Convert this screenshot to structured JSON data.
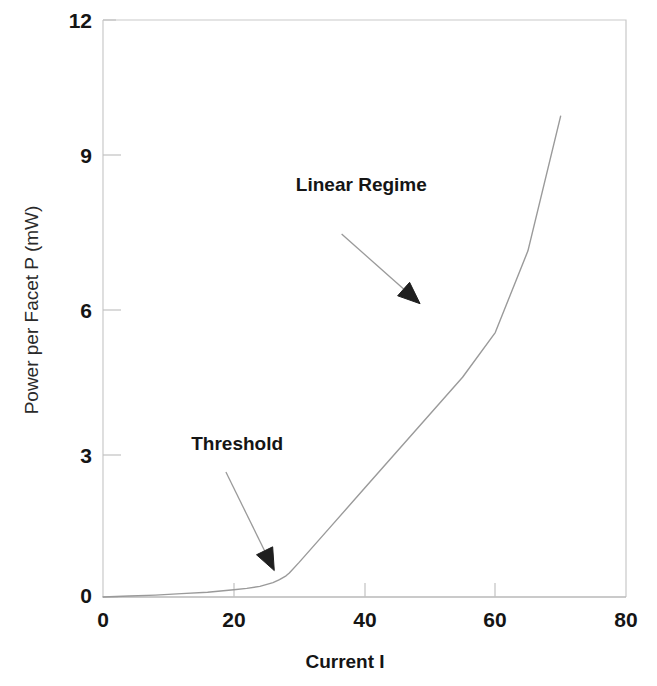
{
  "chart_data": {
    "type": "line",
    "title": "",
    "subtitle": "",
    "xlabel": "Current I",
    "ylabel": "Power per Facet P (mW)",
    "xlim": [
      0,
      80
    ],
    "ylim": [
      0,
      12
    ],
    "xticks": [
      0,
      20,
      40,
      60,
      80
    ],
    "yticks": [
      0,
      3,
      6,
      9,
      12
    ],
    "xtick_labels": [
      "0",
      "20",
      "40",
      "60",
      "80"
    ],
    "ytick_labels": [
      "0",
      "3",
      "6",
      "9",
      "12"
    ],
    "grid": false,
    "legend": null,
    "legend_position": "none",
    "series": [
      {
        "name": "L-I curve",
        "color": "#9a9a9a",
        "x": [
          0,
          4,
          8,
          12,
          16,
          20,
          22,
          24,
          26,
          27,
          28,
          28.5,
          30,
          35,
          40,
          45,
          50,
          55,
          60,
          65,
          70
        ],
        "y": [
          0.0,
          0.02,
          0.04,
          0.07,
          0.1,
          0.15,
          0.18,
          0.22,
          0.3,
          0.36,
          0.44,
          0.5,
          0.72,
          1.49,
          2.26,
          3.03,
          3.8,
          4.57,
          5.5,
          7.2,
          10.0
        ]
      }
    ],
    "annotations": [
      {
        "name": "threshold",
        "text": "Threshold",
        "text_x": 13.5,
        "text_y": 3.05,
        "arrow_from_x": 18.8,
        "arrow_from_y": 2.6,
        "arrow_to_x": 26.2,
        "arrow_to_y": 0.55
      },
      {
        "name": "linear-regime",
        "text": "Linear Regime",
        "text_x": 29.5,
        "text_y": 8.45,
        "arrow_from_x": 36.5,
        "arrow_from_y": 7.55,
        "arrow_to_x": 48.5,
        "arrow_to_y": 6.1
      }
    ],
    "axis_colors": {
      "frame": "#c9c9c9",
      "curve": "#9a9a9a",
      "text": "#151515",
      "background": "#ffffff"
    }
  }
}
